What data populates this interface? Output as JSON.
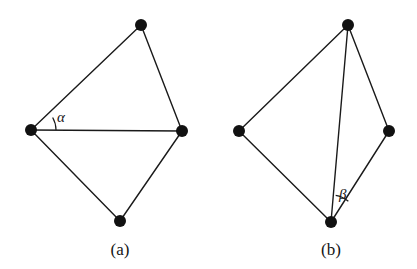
{
  "figure": {
    "background_color": "#ffffff",
    "line_color": "#1a1a1a",
    "vertex_color": "#111111",
    "width": 417,
    "height": 269,
    "panels": [
      {
        "id": "a",
        "caption": "(a)",
        "caption_x": 120,
        "caption_y": 255,
        "angle_symbol": "α",
        "angle_label_x": 57,
        "angle_label_y": 122,
        "angle_vertex": "left",
        "arc": {
          "cx": 31,
          "cy": 130,
          "r": 25,
          "start_deg": 0,
          "end_deg": -30
        },
        "vertices": [
          {
            "name": "top",
            "x": 141,
            "y": 25,
            "r": 6.0
          },
          {
            "name": "right",
            "x": 182,
            "y": 131,
            "r": 6.0
          },
          {
            "name": "bottom",
            "x": 120,
            "y": 221,
            "r": 6.0
          },
          {
            "name": "left",
            "x": 31,
            "y": 130,
            "r": 6.0
          }
        ],
        "edges": [
          {
            "from": "top",
            "to": "right"
          },
          {
            "from": "right",
            "to": "bottom"
          },
          {
            "from": "bottom",
            "to": "left"
          },
          {
            "from": "left",
            "to": "top"
          }
        ],
        "diagonals": [
          {
            "from": "left",
            "to": "right"
          }
        ]
      },
      {
        "id": "b",
        "caption": "(b)",
        "caption_x": 331,
        "caption_y": 255,
        "angle_symbol": "β",
        "angle_label_x": 339,
        "angle_label_y": 199,
        "angle_vertex": "bottom",
        "arc": {
          "cx": 331,
          "cy": 222,
          "r": 27,
          "start_deg": -50,
          "end_deg": -80
        },
        "vertices": [
          {
            "name": "top",
            "x": 348,
            "y": 25,
            "r": 6.0
          },
          {
            "name": "right",
            "x": 389,
            "y": 131,
            "r": 6.0
          },
          {
            "name": "bottom",
            "x": 331,
            "y": 222,
            "r": 6.0
          },
          {
            "name": "left",
            "x": 239,
            "y": 131,
            "r": 6.0
          }
        ],
        "edges": [
          {
            "from": "top",
            "to": "right"
          },
          {
            "from": "right",
            "to": "bottom"
          },
          {
            "from": "bottom",
            "to": "left"
          },
          {
            "from": "left",
            "to": "top"
          }
        ],
        "diagonals": [
          {
            "from": "bottom",
            "to": "top"
          }
        ]
      }
    ]
  }
}
